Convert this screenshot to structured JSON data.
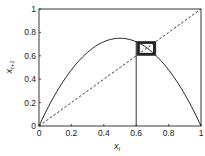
{
  "chart_data": {
    "type": "line",
    "title": "",
    "xlabel": "x_t",
    "ylabel": "x_{t+1}",
    "xlabel_main": "x",
    "xlabel_sub": "t",
    "ylabel_main": "x",
    "ylabel_sub": "t+1",
    "xlim": [
      0,
      1
    ],
    "ylim": [
      0,
      1
    ],
    "xticks": [
      0,
      0.2,
      0.4,
      0.6,
      0.8,
      1
    ],
    "xtick_labels": [
      "0",
      "0.2",
      "0.4",
      "0.6",
      "0.8",
      "1"
    ],
    "yticks": [
      0,
      0.2,
      0.4,
      0.6,
      0.8,
      1
    ],
    "ytick_labels": [
      "0",
      "0.2",
      "0.4",
      "0.6",
      "0.8",
      "1"
    ],
    "grid": false,
    "legend": null,
    "series": [
      {
        "name": "logistic map f(x) = r x (1 - x)",
        "style": "solid",
        "r": 3.0,
        "x": [
          0,
          0.05,
          0.1,
          0.15,
          0.2,
          0.25,
          0.3,
          0.35,
          0.4,
          0.45,
          0.5,
          0.55,
          0.6,
          0.65,
          0.7,
          0.75,
          0.8,
          0.85,
          0.9,
          0.95,
          1
        ],
        "y": [
          0,
          0.1425,
          0.27,
          0.3825,
          0.48,
          0.5625,
          0.63,
          0.6825,
          0.72,
          0.7425,
          0.75,
          0.7425,
          0.72,
          0.6825,
          0.63,
          0.5625,
          0.48,
          0.3825,
          0.27,
          0.1425,
          0
        ]
      },
      {
        "name": "identity line x_{t+1} = x_t",
        "style": "dashed",
        "x": [
          0,
          1
        ],
        "y": [
          0,
          1
        ]
      },
      {
        "name": "cobweb iteration",
        "style": "solid",
        "x0": 0.6,
        "iterations": 14
      }
    ],
    "fixed_point": 0.6667
  }
}
